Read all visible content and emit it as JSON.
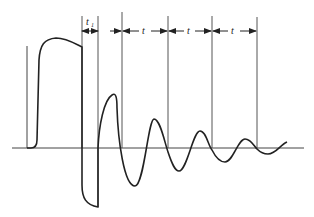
{
  "diagram": {
    "type": "damped-oscillation-waveform",
    "stroke_color": "#222222",
    "background": "#ffffff",
    "labels": {
      "t1_main": "t",
      "t1_sub": "1",
      "period_1": "t",
      "period_2": "t",
      "period_3": "t"
    },
    "axes": {
      "baseline_y": 148,
      "baseline_x_range": [
        12,
        304
      ],
      "left_axis_x": 27,
      "left_axis_y_range": [
        46,
        148
      ]
    },
    "marker_lines_x": [
      82,
      98,
      122,
      168,
      212,
      257
    ],
    "dimension_arrows": [
      {
        "label": "t1",
        "from_x": 82,
        "to_x": 98,
        "y": 31
      },
      {
        "label": "t",
        "from_x": 122,
        "to_x": 168,
        "y": 31
      },
      {
        "label": "t",
        "from_x": 168,
        "to_x": 212,
        "y": 31
      },
      {
        "label": "t",
        "from_x": 212,
        "to_x": 257,
        "y": 31
      }
    ],
    "waveform_features": {
      "pulse_rise_x": 39,
      "pulse_top_y": 38,
      "pulse_fall_x": 82,
      "negative_spike_min": {
        "x": 98,
        "y": 207
      },
      "peaks": [
        {
          "x": 115,
          "y": 95
        },
        {
          "x": 154,
          "y": 120
        },
        {
          "x": 200,
          "y": 131
        },
        {
          "x": 245,
          "y": 139
        }
      ],
      "troughs": [
        {
          "x": 135,
          "y": 186
        },
        {
          "x": 178,
          "y": 171
        },
        {
          "x": 224,
          "y": 162
        },
        {
          "x": 268,
          "y": 154
        }
      ]
    }
  }
}
